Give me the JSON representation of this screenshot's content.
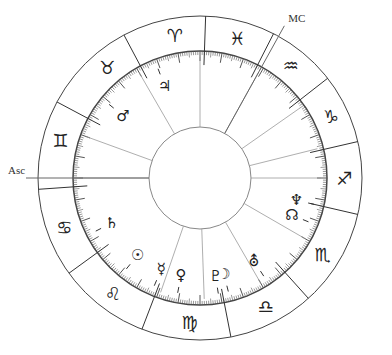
{
  "chart_title": "Natal chart wheel",
  "angles": [
    {
      "name": "asc",
      "label": "Asc",
      "longitude": 180
    },
    {
      "name": "mc",
      "label": "MC",
      "longitude": 61
    }
  ],
  "signs": [
    {
      "name": "aries",
      "glyph": "♈",
      "mid": 100
    },
    {
      "name": "pisces",
      "glyph": "♓",
      "mid": 75
    },
    {
      "name": "aquarius-alt",
      "glyph": "♒",
      "mid": 51
    },
    {
      "name": "capricorn-alt",
      "glyph": "♑",
      "mid": 25
    },
    {
      "name": "sagittarius-alt",
      "glyph": "♐",
      "mid": 0
    },
    {
      "name": "scorpio-alt",
      "glyph": "♏",
      "mid": -32
    },
    {
      "name": "libra-alt",
      "glyph": "♎",
      "mid": -63
    },
    {
      "name": "virgo-alt",
      "glyph": "♍",
      "mid": -94
    },
    {
      "name": "leo",
      "glyph": "♌",
      "mid": -127
    },
    {
      "name": "cancer",
      "glyph": "♋",
      "mid": -160
    },
    {
      "name": "gemini",
      "glyph": "♊",
      "mid": 165
    },
    {
      "name": "taurus",
      "glyph": "♉",
      "mid": 130
    }
  ],
  "sign_boundaries": [
    88,
    63,
    38,
    13,
    -13,
    -48,
    -79,
    -111,
    -144,
    -176,
    152,
    118
  ],
  "house_cusps": [
    180,
    160,
    120,
    90,
    61,
    35,
    14,
    0,
    -30,
    -60,
    -88,
    -109
  ],
  "planets": [
    {
      "name": "jupiter",
      "glyph": "♃",
      "longitude": 111
    },
    {
      "name": "mars",
      "glyph": "♂",
      "longitude": 141
    },
    {
      "name": "saturn",
      "glyph": "♄",
      "longitude": -153
    },
    {
      "name": "sun",
      "glyph": "☉",
      "longitude": -129
    },
    {
      "name": "mercury",
      "glyph": "☿",
      "longitude": -113
    },
    {
      "name": "venus",
      "glyph": "♀",
      "longitude": -101
    },
    {
      "name": "pluto",
      "glyph": "♇",
      "longitude": -81
    },
    {
      "name": "moon",
      "glyph": "☽",
      "longitude": -76
    },
    {
      "name": "uranus",
      "glyph": "⛢",
      "longitude": -57
    },
    {
      "name": "north-node",
      "glyph": "☊",
      "longitude": -22
    },
    {
      "name": "neptune",
      "glyph": "♆",
      "longitude": -13
    }
  ]
}
